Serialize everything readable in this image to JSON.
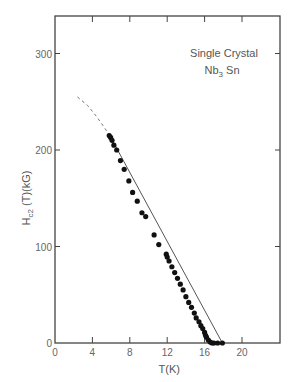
{
  "chart_data": {
    "type": "scatter",
    "annotation_line1": "Single  Crystal",
    "annotation_line2_main": "Nb",
    "annotation_line2_sub": "3",
    "annotation_line2_tail": " Sn",
    "xlabel": "T(K)",
    "ylabel_main": "H",
    "ylabel_sub": "c2",
    "ylabel_tail": " (T)(kG)",
    "xlim": [
      0,
      24
    ],
    "ylim": [
      0,
      340
    ],
    "x_ticks": [
      0,
      4,
      8,
      12,
      16,
      20
    ],
    "x_tick_labels": [
      "0",
      "4",
      "8",
      "12",
      "16",
      "20"
    ],
    "y_ticks": [
      0,
      100,
      200,
      300
    ],
    "y_tick_labels": [
      "0",
      "100",
      "200",
      "300"
    ],
    "grid": false,
    "legend": "none",
    "series": [
      {
        "name": "measured",
        "marker": "filled-circle",
        "x": [
          5.8,
          5.95,
          6.1,
          6.3,
          6.6,
          7.0,
          7.4,
          7.9,
          8.3,
          8.8,
          9.3,
          9.7,
          10.6,
          11.1,
          11.9,
          12.0,
          12.2,
          12.5,
          12.8,
          13.1,
          13.4,
          13.7,
          14.0,
          14.3,
          14.6,
          14.9,
          15.1,
          15.4,
          15.6,
          15.8,
          16.0,
          16.1,
          16.2,
          16.4,
          16.6,
          16.8,
          17.0,
          17.4,
          17.9
        ],
        "y": [
          215,
          213,
          210,
          205,
          200,
          189,
          180,
          168,
          156,
          147,
          135,
          131,
          112,
          102,
          92,
          89,
          85,
          79,
          73,
          67,
          61,
          55,
          48,
          42,
          37,
          31,
          26,
          22,
          18,
          15,
          11,
          8,
          6,
          3,
          1,
          0,
          0,
          0,
          0
        ]
      },
      {
        "name": "fit",
        "style": "solid-line",
        "x": [
          5.8,
          17.9
        ],
        "y": [
          216,
          0
        ]
      },
      {
        "name": "extrapolation",
        "style": "dashed-line",
        "x": [
          2.4,
          3.5,
          4.5,
          5.8
        ],
        "y": [
          255,
          246,
          234,
          216
        ]
      }
    ]
  }
}
